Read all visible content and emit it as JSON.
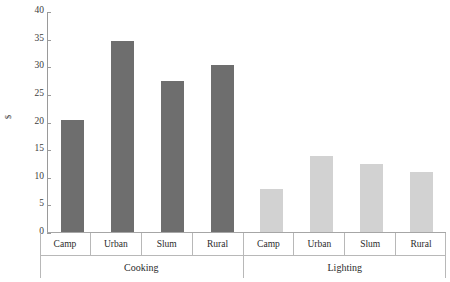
{
  "chart_data": {
    "type": "bar",
    "title": "",
    "subtitle": "",
    "xlabel": "",
    "ylabel": "$",
    "ylim": [
      0,
      40
    ],
    "y_ticks": [
      0,
      5,
      10,
      15,
      20,
      25,
      30,
      35,
      40
    ],
    "grid": false,
    "legend": "none",
    "categories": [
      "Camp",
      "Urban",
      "Slum",
      "Rural"
    ],
    "groups": [
      "Cooking",
      "Lighting"
    ],
    "series": [
      {
        "name": "Cooking",
        "values": [
          20.5,
          34.8,
          27.5,
          30.5
        ],
        "color": "#6e6e6e"
      },
      {
        "name": "Lighting",
        "values": [
          8.0,
          14.0,
          12.5,
          11.0
        ],
        "color": "#d2d2d2"
      }
    ],
    "bars": [
      {
        "group": "Cooking",
        "category": "Camp",
        "value": 20.5,
        "color": "#6e6e6e"
      },
      {
        "group": "Cooking",
        "category": "Urban",
        "value": 34.8,
        "color": "#6e6e6e"
      },
      {
        "group": "Cooking",
        "category": "Slum",
        "value": 27.5,
        "color": "#6e6e6e"
      },
      {
        "group": "Cooking",
        "category": "Rural",
        "value": 30.5,
        "color": "#6e6e6e"
      },
      {
        "group": "Lighting",
        "category": "Camp",
        "value": 8.0,
        "color": "#d2d2d2"
      },
      {
        "group": "Lighting",
        "category": "Urban",
        "value": 14.0,
        "color": "#d2d2d2"
      },
      {
        "group": "Lighting",
        "category": "Slum",
        "value": 12.5,
        "color": "#d2d2d2"
      },
      {
        "group": "Lighting",
        "category": "Rural",
        "value": 11.0,
        "color": "#d2d2d2"
      }
    ],
    "axis_color": "#9a9a9a",
    "table_border_color": "#b8b8b8"
  }
}
